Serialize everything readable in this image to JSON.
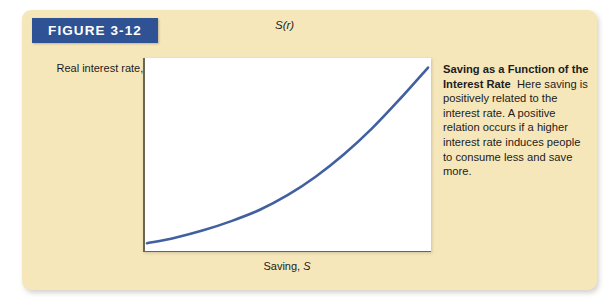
{
  "figure": {
    "banner_label": "FIGURE 3-12",
    "banner_color": "#2e5294",
    "card_color": "#f6e7bb"
  },
  "caption": {
    "title": "Saving as a Function of the Interest Rate",
    "body": "Here saving is positively related to the interest rate. A positive relation occurs if a higher interest rate induces people to consume less and save more."
  },
  "chart_data": {
    "type": "line",
    "title": "Saving as a Function of the Interest Rate",
    "xlabel": "Saving, S",
    "ylabel": "Real interest rate, r",
    "series": [
      {
        "name": "S(r)",
        "label": "S(r)",
        "color": "#41609f",
        "shape": "convex-increasing",
        "x": [
          0.0,
          0.1,
          0.2,
          0.3,
          0.4,
          0.5,
          0.6,
          0.7,
          0.8,
          0.9,
          1.0
        ],
        "y": [
          0.02,
          0.05,
          0.09,
          0.14,
          0.2,
          0.28,
          0.38,
          0.5,
          0.64,
          0.8,
          0.97
        ]
      }
    ],
    "xlim": [
      0,
      1
    ],
    "ylim": [
      0,
      1
    ],
    "grid": false,
    "legend": "none",
    "axis_ticks": "none"
  },
  "axes": {
    "x_title_text": "Saving, ",
    "x_title_italic": "S",
    "y_title_text": "Real interest rate, ",
    "y_title_italic": "r",
    "curve_label": "S(r)"
  }
}
